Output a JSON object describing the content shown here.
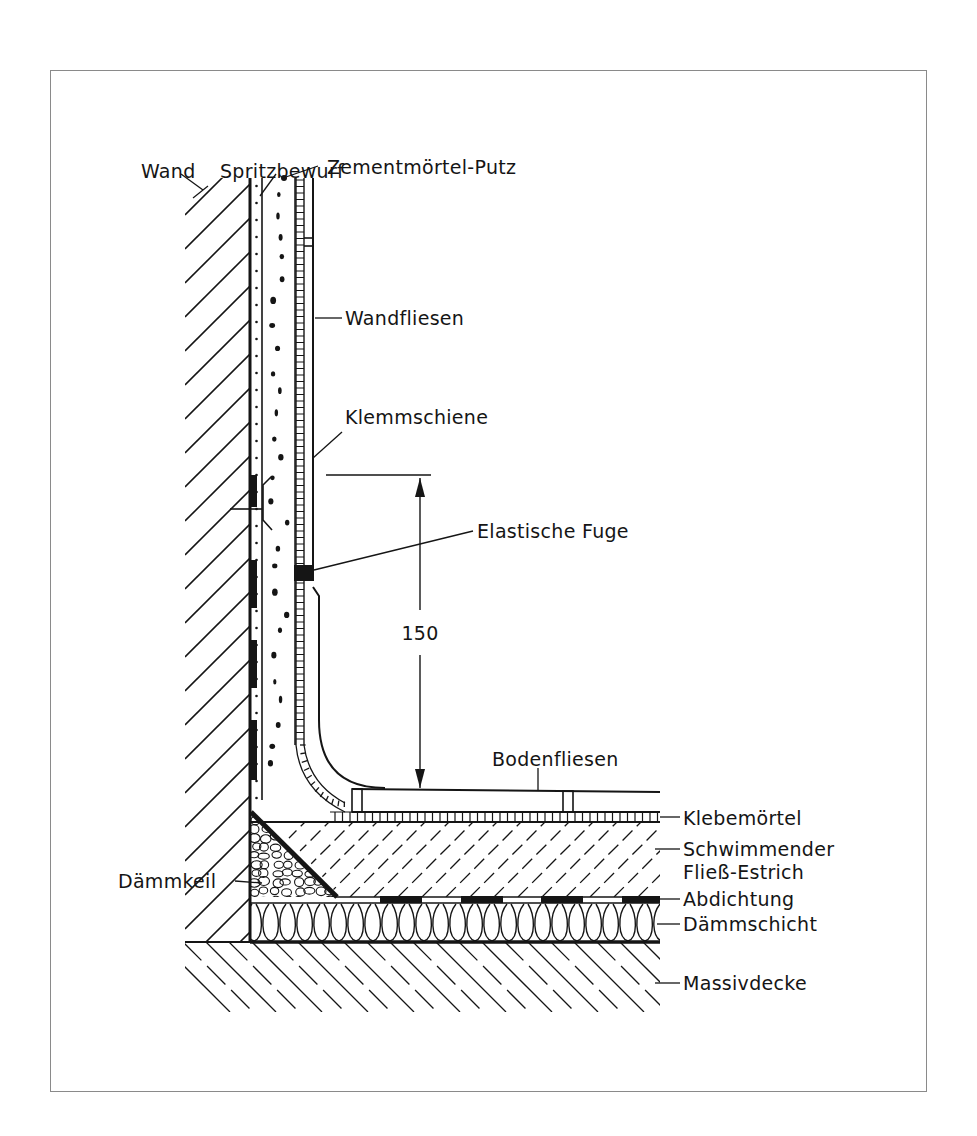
{
  "diagram": {
    "type": "construction-section",
    "dimension": {
      "value": "150",
      "meaning": "height of waterproofing upturn above floor tiles"
    },
    "labels": {
      "wand": "Wand",
      "spritzbewurf": "Spritzbewurf",
      "zementmoertel_putz": "Zementmörtel-Putz",
      "wandfliesen": "Wandfliesen",
      "klemmschiene": "Klemmschiene",
      "elastische_fuge": "Elastische Fuge",
      "bodenfliesen": "Bodenfliesen",
      "klebemoertel": "Klebemörtel",
      "schwimmender_line1": "Schwimmender",
      "schwimmender_line2": "Fließ-Estrich",
      "abdichtung": "Abdichtung",
      "daemmschicht": "Dämmschicht",
      "daemmkeil": "Dämmkeil",
      "massivdecke": "Massivdecke"
    },
    "layers_wall": [
      "Wand",
      "Spritzbewurf",
      "Zementmörtel-Putz",
      "Wandfliesen"
    ],
    "layers_floor_top_to_bottom": [
      "Bodenfliesen",
      "Klebemörtel",
      "Schwimmender Fließ-Estrich",
      "Abdichtung",
      "Dämmschicht",
      "Massivdecke"
    ],
    "colors": {
      "ink": "#151515",
      "frame": "#8a8a8a",
      "paper": "#ffffff"
    }
  }
}
